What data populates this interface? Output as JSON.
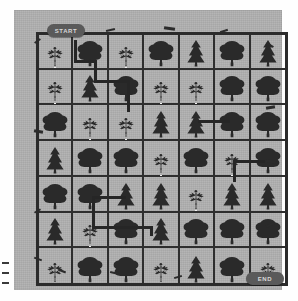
{
  "board": {
    "title": "Forest Maze Board",
    "start_label": "START",
    "end_label": "END",
    "columns": 7,
    "rows": 7,
    "colors": {
      "paper": "#b0b0b0",
      "ink": "#2e2e2e",
      "tree_fill": "#2a2a2a",
      "path_dots": "#f4f4f4",
      "pill_bg": "#5a5a5a",
      "pill_text": "#d8d8d8",
      "page_bg": "#fefefe"
    }
  },
  "legend": [
    {
      "key": "deciduous",
      "label": "Deciduous tree"
    },
    {
      "key": "conifer",
      "label": "Conifer tree"
    },
    {
      "key": "sapling",
      "label": "Sapling"
    }
  ],
  "cells": [
    {
      "row": 1,
      "col": 1,
      "type": "sapling",
      "path": true
    },
    {
      "row": 1,
      "col": 2,
      "type": "deciduous",
      "path": false
    },
    {
      "row": 1,
      "col": 3,
      "type": "sapling",
      "path": true
    },
    {
      "row": 1,
      "col": 4,
      "type": "deciduous",
      "path": false
    },
    {
      "row": 1,
      "col": 5,
      "type": "conifer",
      "path": false
    },
    {
      "row": 1,
      "col": 6,
      "type": "deciduous",
      "path": false
    },
    {
      "row": 1,
      "col": 7,
      "type": "conifer",
      "path": false
    },
    {
      "row": 2,
      "col": 1,
      "type": "sapling",
      "path": true
    },
    {
      "row": 2,
      "col": 2,
      "type": "conifer",
      "path": false
    },
    {
      "row": 2,
      "col": 3,
      "type": "deciduous",
      "path": false
    },
    {
      "row": 2,
      "col": 4,
      "type": "sapling",
      "path": true
    },
    {
      "row": 2,
      "col": 5,
      "type": "sapling",
      "path": true
    },
    {
      "row": 2,
      "col": 6,
      "type": "deciduous",
      "path": false
    },
    {
      "row": 2,
      "col": 7,
      "type": "deciduous",
      "path": false
    },
    {
      "row": 3,
      "col": 1,
      "type": "deciduous",
      "path": false
    },
    {
      "row": 3,
      "col": 2,
      "type": "sapling",
      "path": true
    },
    {
      "row": 3,
      "col": 3,
      "type": "sapling",
      "path": true
    },
    {
      "row": 3,
      "col": 4,
      "type": "conifer",
      "path": false
    },
    {
      "row": 3,
      "col": 5,
      "type": "conifer",
      "path": false
    },
    {
      "row": 3,
      "col": 6,
      "type": "deciduous",
      "path": false
    },
    {
      "row": 3,
      "col": 7,
      "type": "deciduous",
      "path": false
    },
    {
      "row": 4,
      "col": 1,
      "type": "conifer",
      "path": false
    },
    {
      "row": 4,
      "col": 2,
      "type": "deciduous",
      "path": false
    },
    {
      "row": 4,
      "col": 3,
      "type": "deciduous",
      "path": false
    },
    {
      "row": 4,
      "col": 4,
      "type": "sapling",
      "path": true
    },
    {
      "row": 4,
      "col": 5,
      "type": "deciduous",
      "path": false
    },
    {
      "row": 4,
      "col": 6,
      "type": "sapling",
      "path": true
    },
    {
      "row": 4,
      "col": 7,
      "type": "deciduous",
      "path": false
    },
    {
      "row": 5,
      "col": 1,
      "type": "deciduous",
      "path": false
    },
    {
      "row": 5,
      "col": 2,
      "type": "deciduous",
      "path": false
    },
    {
      "row": 5,
      "col": 3,
      "type": "conifer",
      "path": false
    },
    {
      "row": 5,
      "col": 4,
      "type": "conifer",
      "path": false
    },
    {
      "row": 5,
      "col": 5,
      "type": "sapling",
      "path": true
    },
    {
      "row": 5,
      "col": 6,
      "type": "conifer",
      "path": false
    },
    {
      "row": 5,
      "col": 7,
      "type": "conifer",
      "path": false
    },
    {
      "row": 6,
      "col": 1,
      "type": "conifer",
      "path": false
    },
    {
      "row": 6,
      "col": 2,
      "type": "sapling",
      "path": true
    },
    {
      "row": 6,
      "col": 3,
      "type": "deciduous",
      "path": false
    },
    {
      "row": 6,
      "col": 4,
      "type": "conifer",
      "path": false
    },
    {
      "row": 6,
      "col": 5,
      "type": "deciduous",
      "path": false
    },
    {
      "row": 6,
      "col": 6,
      "type": "deciduous",
      "path": false
    },
    {
      "row": 6,
      "col": 7,
      "type": "deciduous",
      "path": false
    },
    {
      "row": 7,
      "col": 1,
      "type": "sapling",
      "path": true
    },
    {
      "row": 7,
      "col": 2,
      "type": "deciduous",
      "path": false
    },
    {
      "row": 7,
      "col": 3,
      "type": "deciduous",
      "path": false
    },
    {
      "row": 7,
      "col": 4,
      "type": "sapling",
      "path": true
    },
    {
      "row": 7,
      "col": 5,
      "type": "conifer",
      "path": false
    },
    {
      "row": 7,
      "col": 6,
      "type": "deciduous",
      "path": false
    },
    {
      "row": 7,
      "col": 7,
      "type": "sapling",
      "path": true
    }
  ],
  "connectors": [
    {
      "id": "c1",
      "orient": "v",
      "left": 60,
      "top": 30,
      "len": 22
    },
    {
      "id": "c2",
      "orient": "h",
      "left": 60,
      "top": 50,
      "len": 22
    },
    {
      "id": "c3",
      "orient": "v",
      "left": 80,
      "top": 50,
      "len": 22
    },
    {
      "id": "c4",
      "orient": "h",
      "left": 80,
      "top": 70,
      "len": 34
    },
    {
      "id": "c5",
      "orient": "v",
      "left": 113,
      "top": 70,
      "len": 32
    },
    {
      "id": "c6",
      "orient": "h",
      "left": 184,
      "top": 110,
      "len": 32
    },
    {
      "id": "c7",
      "orient": "h",
      "left": 219,
      "top": 150,
      "len": 32
    },
    {
      "id": "c8",
      "orient": "v",
      "left": 219,
      "top": 150,
      "len": 22
    },
    {
      "id": "c9",
      "orient": "h",
      "left": 78,
      "top": 186,
      "len": 34
    },
    {
      "id": "c10",
      "orient": "v",
      "left": 78,
      "top": 186,
      "len": 30
    },
    {
      "id": "c11",
      "orient": "h",
      "left": 78,
      "top": 216,
      "len": 58
    },
    {
      "id": "c12",
      "orient": "v",
      "left": 136,
      "top": 216,
      "len": 10
    }
  ],
  "edge_ticks": [
    {
      "top": 262
    },
    {
      "top": 272
    },
    {
      "top": 282
    }
  ]
}
